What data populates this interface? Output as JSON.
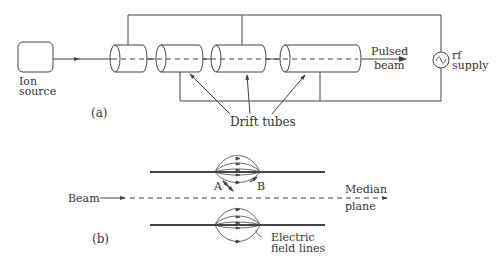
{
  "figure_a": {
    "panel_label": "(a)",
    "ion_source": {
      "line1": "Ion",
      "line2": "source"
    },
    "pulsed_beam": {
      "line1": "Pulsed",
      "line2": "beam"
    },
    "rf_supply": {
      "symbol": "~",
      "line1": "rf",
      "line2": "supply"
    },
    "drift_tubes_label": "Drift tubes",
    "tube_count": 4
  },
  "figure_b": {
    "panel_label": "(b)",
    "beam_label": "Beam",
    "median_plane": {
      "line1": "Median",
      "line2": "plane"
    },
    "point_a": "A",
    "point_b": "B",
    "field_lines_label": {
      "line1": "Electric",
      "line2": "field lines"
    }
  },
  "colors": {
    "line": "#444444",
    "text": "#333333",
    "background": "#ffffff"
  }
}
